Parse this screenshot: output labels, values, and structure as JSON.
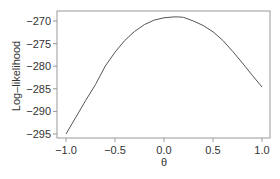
{
  "chart_data": {
    "type": "line",
    "title": "",
    "xlabel": "θ",
    "ylabel": "Log–likelihood",
    "xlim": [
      -1.06,
      1.06
    ],
    "ylim": [
      -296,
      -268.5
    ],
    "grid": false,
    "legend": null,
    "x_ticks": [
      -1.0,
      -0.5,
      0.0,
      0.5,
      1.0
    ],
    "x_tick_labels": [
      "−1.0",
      "−0.5",
      "0.0",
      "0.5",
      "1.0"
    ],
    "y_ticks": [
      -270,
      -275,
      -280,
      -285,
      -290,
      -295
    ],
    "y_tick_labels": [
      "−270",
      "−275",
      "−280",
      "−285",
      "−290",
      "−295"
    ],
    "series": [
      {
        "name": "log-likelihood",
        "color": "#555555",
        "x": [
          -1.0,
          -0.9,
          -0.8,
          -0.7,
          -0.6,
          -0.5,
          -0.4,
          -0.3,
          -0.2,
          -0.1,
          0.0,
          0.1,
          0.15,
          0.2,
          0.3,
          0.4,
          0.5,
          0.6,
          0.7,
          0.8,
          0.9,
          1.0
        ],
        "y": [
          -295.0,
          -291.3,
          -287.6,
          -284.1,
          -280.0,
          -276.9,
          -274.3,
          -272.3,
          -270.8,
          -269.8,
          -269.3,
          -269.1,
          -269.1,
          -269.2,
          -270.0,
          -271.0,
          -272.4,
          -274.3,
          -276.7,
          -279.3,
          -282.0,
          -284.6
        ]
      }
    ]
  }
}
